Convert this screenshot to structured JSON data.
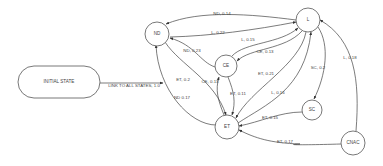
{
  "diagram": {
    "type": "state-transition",
    "initial_state": {
      "label": "INITIAL STATE",
      "link_label": "LINK TO ALL STATES, 1.0"
    },
    "nodes": [
      {
        "id": "ND",
        "label": "ND"
      },
      {
        "id": "L",
        "label": "L"
      },
      {
        "id": "CE",
        "label": "CE"
      },
      {
        "id": "ET",
        "label": "ET"
      },
      {
        "id": "SC",
        "label": "SC"
      },
      {
        "id": "CNAC",
        "label": "CNAC"
      }
    ],
    "edges": [
      {
        "from": "L",
        "to": "ND",
        "label": "ND, 0.14"
      },
      {
        "from": "ND",
        "to": "L",
        "label": "L, 0.22"
      },
      {
        "from": "CE",
        "to": "ND",
        "label": "ND, 0.23"
      },
      {
        "from": "CE",
        "to": "L",
        "label": "L, 0.15"
      },
      {
        "from": "L",
        "to": "CE",
        "label": "CE, 0.13"
      },
      {
        "from": "ND",
        "to": "ET",
        "label": "ET, 0.2"
      },
      {
        "from": "ET",
        "to": "ND",
        "label": "ND 0.17"
      },
      {
        "from": "ET",
        "to": "CE",
        "label": "CE, 0.13"
      },
      {
        "from": "CE",
        "to": "ET",
        "label": "ET, 0.11"
      },
      {
        "from": "L",
        "to": "ET",
        "label": "ET, 0.21"
      },
      {
        "from": "ET",
        "to": "L",
        "label": "L, 0.16"
      },
      {
        "from": "L",
        "to": "SC",
        "label": "SC, 0.2"
      },
      {
        "from": "SC",
        "to": "ET",
        "label": "ET, 0.15"
      },
      {
        "from": "CNAC",
        "to": "ET",
        "label": "ET, 0.17"
      },
      {
        "from": "CNAC",
        "to": "L",
        "label": "L, 0.18"
      }
    ]
  }
}
